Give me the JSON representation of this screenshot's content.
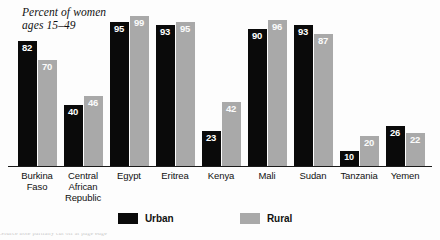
{
  "chart_data": {
    "type": "bar",
    "title": "Percent of women\nages 15–49",
    "xlabel": "",
    "ylabel": "",
    "ylim": [
      0,
      100
    ],
    "grid": false,
    "legend_position": "bottom-center",
    "categories": [
      "Burkina\nFaso",
      "Central\nAfrican\nRepublic",
      "Egypt",
      "Eritrea",
      "Kenya",
      "Mali",
      "Sudan",
      "Tanzania",
      "Yemen"
    ],
    "series": [
      {
        "name": "Urban",
        "color": "#0a0a0a",
        "values": [
          82,
          40,
          95,
          93,
          23,
          90,
          93,
          10,
          26
        ]
      },
      {
        "name": "Rural",
        "color": "#a9a9a9",
        "values": [
          70,
          46,
          99,
          95,
          42,
          96,
          87,
          20,
          22
        ]
      }
    ]
  },
  "legend": {
    "urban_label": "Urban",
    "rural_label": "Rural"
  },
  "footnote": {
    "text": "cut off source line"
  }
}
